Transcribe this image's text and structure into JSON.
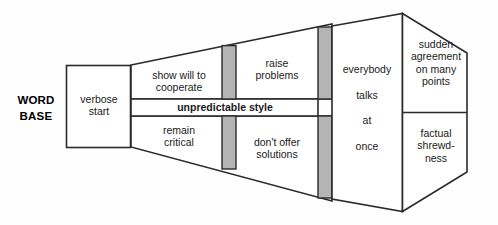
{
  "diagram": {
    "colors": {
      "stroke": "#2b2b2b",
      "panel_fill": "#ffffff",
      "divider_fill": "#b4b4b4",
      "text": "#1a1a1a",
      "background": "#fefefe"
    },
    "labels": {
      "word_base": "WORD\nBASE",
      "verbose_start": "verbose\nstart",
      "show_will": "show will to\ncooperate",
      "remain_critical": "remain\ncritical",
      "unpredictable_style": "unpredictable style",
      "raise_problems": "raise\nproblems",
      "dont_offer_solutions": "don't offer\nsolutions",
      "everybody_talks": "everybody\ntalks\nat\nonce",
      "sudden_agreement": "sudden\nagreement\non many\npoints",
      "factual_shrewdness": "factual\nshrewd-\nness"
    },
    "stages": [
      {
        "name": "word-base",
        "label": "WORD BASE",
        "type": "outside-label"
      },
      {
        "name": "verbose-start",
        "label": "verbose start",
        "type": "box"
      },
      {
        "name": "stage-2-upper",
        "label": "show will to cooperate",
        "type": "trapezoid-upper"
      },
      {
        "name": "stage-2-lower",
        "label": "remain critical",
        "type": "trapezoid-lower"
      },
      {
        "name": "center-band",
        "label": "unpredictable style",
        "type": "band"
      },
      {
        "name": "stage-3-upper",
        "label": "raise problems",
        "type": "trapezoid-upper"
      },
      {
        "name": "stage-3-lower",
        "label": "don't offer solutions",
        "type": "trapezoid-lower"
      },
      {
        "name": "stage-4",
        "label": "everybody talks at once",
        "type": "column"
      },
      {
        "name": "stage-5-upper",
        "label": "sudden agreement on many points",
        "type": "hex-upper"
      },
      {
        "name": "stage-5-lower",
        "label": "factual shrewdness",
        "type": "hex-lower"
      }
    ]
  }
}
